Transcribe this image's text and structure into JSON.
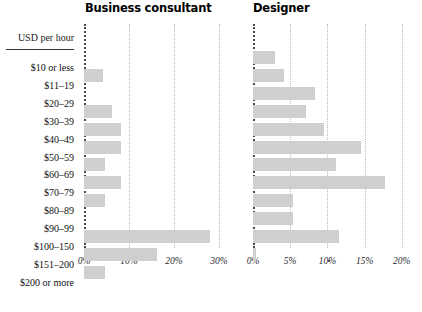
{
  "chart_data": {
    "type": "bar",
    "orientation": "horizontal",
    "title": "",
    "subtitle": "",
    "xlabel": "",
    "ylabel": "USD per hour",
    "grid": true,
    "legend": "none",
    "categories": [
      "$10 or less",
      "$11–19",
      "$20–29",
      "$30–39",
      "$40–49",
      "$50–59",
      "$60–69",
      "$70–79",
      "$80–89",
      "$90–99",
      "$100–150",
      "$151–200",
      "$200 or more"
    ],
    "panels": [
      {
        "name": "Business consultant",
        "xlim": [
          0,
          32
        ],
        "xticks": [
          0,
          10,
          20,
          30
        ],
        "xticklabels": [
          "0%",
          "10%",
          "20%",
          "30%"
        ],
        "values": [
          0,
          4.2,
          0,
          6.2,
          8.2,
          8.2,
          4.6,
          8.2,
          4.6,
          0,
          28.0,
          16.2,
          4.6
        ]
      },
      {
        "name": "Designer",
        "xlim": [
          0,
          21.5
        ],
        "xticks": [
          0,
          5,
          10,
          15,
          20
        ],
        "xticklabels": [
          "0%",
          "5%",
          "10%",
          "15%",
          "20%"
        ],
        "values": [
          3.0,
          4.1,
          8.3,
          7.1,
          9.6,
          14.5,
          11.1,
          17.7,
          5.4,
          5.4,
          11.6,
          0.4,
          0
        ]
      }
    ]
  },
  "colors": {
    "bar_fill": "#cfcfcf",
    "gridline": "#b9b9b9",
    "axis": "#4a4a4a",
    "text": "#111111"
  }
}
